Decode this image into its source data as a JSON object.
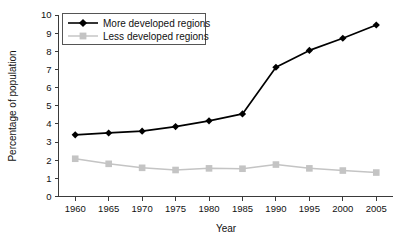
{
  "chart_data": {
    "type": "line",
    "title": "",
    "xlabel": "Year",
    "ylabel": "Percentage of population",
    "x": [
      1960,
      1965,
      1970,
      1975,
      1980,
      1985,
      1990,
      1995,
      2000,
      2005
    ],
    "xtick_labels": [
      "1960",
      "1965",
      "1970",
      "1975",
      "1980",
      "1985",
      "1990",
      "1995",
      "2000",
      "2005"
    ],
    "ytick_labels": [
      "0",
      "1",
      "2",
      "3",
      "4",
      "5",
      "6",
      "7",
      "8",
      "9",
      "10"
    ],
    "xlim": [
      1957.5,
      2007.5
    ],
    "ylim": [
      0,
      10
    ],
    "grid": false,
    "legend_position": "top-left",
    "series": [
      {
        "name": "More developed regions",
        "color": "#000000",
        "marker": "diamond",
        "values": [
          3.4,
          3.5,
          3.6,
          3.85,
          4.17,
          4.55,
          7.12,
          8.05,
          8.72,
          9.45
        ]
      },
      {
        "name": "Less developed regions",
        "color": "#c4c4c4",
        "marker": "square",
        "values": [
          2.08,
          1.8,
          1.58,
          1.46,
          1.55,
          1.53,
          1.76,
          1.55,
          1.43,
          1.32
        ]
      }
    ]
  },
  "legend": {
    "entries": [
      {
        "label": "More developed regions"
      },
      {
        "label": "Less developed regions"
      }
    ]
  },
  "axes": {
    "y_title": "Percentage of population",
    "x_title": "Year"
  }
}
